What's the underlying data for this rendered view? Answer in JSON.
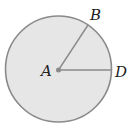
{
  "diagram": {
    "type": "circle-with-radii",
    "fill_color": "#e6e6e6",
    "stroke_color": "#8a8a8a",
    "points": {
      "A": {
        "label": "A",
        "role": "center"
      },
      "B": {
        "label": "B",
        "role": "point on circle"
      },
      "D": {
        "label": "D",
        "role": "point on circle"
      }
    },
    "segments": [
      "AB",
      "AD"
    ]
  }
}
